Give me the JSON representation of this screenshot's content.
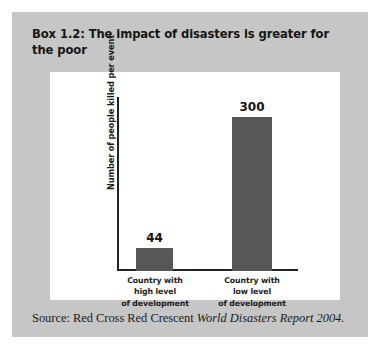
{
  "figure": {
    "title": "Box 1.2: The impact of disasters is greater for the poor",
    "background_color": "#c6c6c6",
    "panel_color": "#ffffff",
    "source_prefix": "Source: Red Cross Red Crescent ",
    "source_italic": "World Disasters Report 2004."
  },
  "chart_data": {
    "type": "bar",
    "title": "",
    "xlabel": "",
    "ylabel": "Number of people killed per event",
    "categories": [
      "Country with high level of development",
      "Country with low level of development"
    ],
    "category_lines": [
      [
        "Country with",
        "high level",
        "of development"
      ],
      [
        "Country with",
        "low level",
        "of development"
      ]
    ],
    "values": [
      44,
      300
    ],
    "value_labels": [
      "44",
      "300"
    ],
    "ylim": [
      0,
      340
    ],
    "grid": false,
    "legend": "none",
    "bar_color": "#575757",
    "axis_color": "#222222"
  }
}
